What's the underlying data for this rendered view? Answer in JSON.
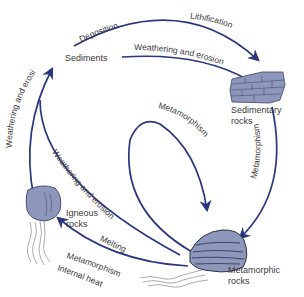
{
  "colors": {
    "arrow": "#2b3580",
    "rock_fill": "#8d97bb",
    "rock_dark": "#3b4266",
    "text": "#3a3a3a",
    "background": "#ffffff"
  },
  "nodes": {
    "sediments": {
      "label": "Sediments"
    },
    "sedimentary": {
      "label_line1": "Sedimentary",
      "label_line2": "rocks"
    },
    "igneous": {
      "label_line1": "Igneous",
      "label_line2": "rocks"
    },
    "metamorphic": {
      "label_line1": "Metamorphic",
      "label_line2": "rocks"
    },
    "internal_heat": {
      "label": "Internal heat"
    }
  },
  "processes": {
    "deposition": "Deposition",
    "lithification": "Lithification",
    "weathering_sed_to_sediments": "Weathering and erosion",
    "weathering_igneous_to_sediments": "Weathering and erosion",
    "weathering_meta_to_sediments": "Weathering and erosion",
    "metamorphism_loop": "Metamorphism",
    "metamorphism_sed_to_meta": "Metamorphism",
    "melting": "Melting",
    "metamorphism_igneous": "Metamorphism"
  }
}
